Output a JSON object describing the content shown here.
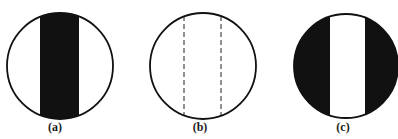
{
  "figure": {
    "panels": [
      {
        "id": "a",
        "label": "(a)",
        "description": "circle with dark vertical central band",
        "circle": {
          "cx": 60,
          "cy": 66,
          "r": 53
        },
        "band": {
          "x1": 40,
          "x2": 79,
          "fill": "dark-center"
        }
      },
      {
        "id": "b",
        "label": "(b)",
        "description": "circle with two dashed vertical lines",
        "circle": {
          "cx": 203,
          "cy": 66,
          "r": 53
        },
        "band": {
          "x1": 184,
          "x2": 221,
          "fill": "dashed-lines"
        }
      },
      {
        "id": "c",
        "label": "(c)",
        "description": "dark circle with light vertical central band",
        "circle": {
          "cx": 346,
          "cy": 66,
          "r": 52
        },
        "band": {
          "x1": 330,
          "x2": 365,
          "fill": "light-center"
        }
      }
    ],
    "colors": {
      "ink": "#111111",
      "paper": "#ffffff"
    }
  }
}
